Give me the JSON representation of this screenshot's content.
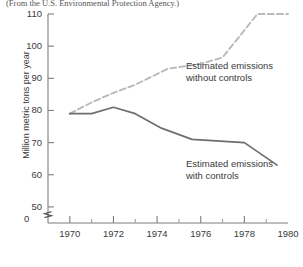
{
  "caption": {
    "source_note": "(From the U.S. Environmental Protection Agency.)"
  },
  "chart_data": {
    "type": "line",
    "title": "",
    "xlabel": "",
    "ylabel": "Million metric tons per year",
    "xlim": [
      1969,
      1980
    ],
    "ylim": [
      45,
      110
    ],
    "y_axis_broken_at_zero": true,
    "zero_tick_label": "0",
    "grid": false,
    "legend_position": "inline-annotations",
    "yticks": [
      50,
      60,
      70,
      80,
      90,
      100,
      110
    ],
    "ytick_labels": [
      "50",
      "60",
      "70",
      "80",
      "90",
      "100",
      "110"
    ],
    "xticks": [
      1970,
      1972,
      1974,
      1976,
      1978,
      1980
    ],
    "xtick_labels": [
      "1970",
      "1972",
      "1974",
      "1976",
      "1978",
      "1980"
    ],
    "xticks_minor": [
      1971,
      1973,
      1975,
      1977,
      1979
    ],
    "series": [
      {
        "name": "Estimated emissions without controls",
        "style": "dashed",
        "color": "#b9b9b9",
        "annotation_lines": [
          "Estimated emissions",
          "without controls"
        ],
        "x": [
          1970.0,
          1971.0,
          1972.0,
          1973.0,
          1974.5,
          1976.0,
          1977.0,
          1978.6,
          1980.0
        ],
        "y": [
          79.0,
          82.5,
          85.5,
          88.0,
          93.0,
          94.5,
          96.5,
          110.0,
          110.0
        ]
      },
      {
        "name": "Estimated emissions with controls",
        "style": "solid",
        "color": "#6e6e6e",
        "annotation_lines": [
          "Estimated emissions",
          "with controls"
        ],
        "x": [
          1970.0,
          1971.0,
          1972.0,
          1973.0,
          1974.2,
          1975.6,
          1978.0,
          1979.5
        ],
        "y": [
          79.0,
          79.0,
          81.0,
          79.0,
          74.5,
          71.0,
          70.0,
          63.0
        ]
      }
    ]
  }
}
